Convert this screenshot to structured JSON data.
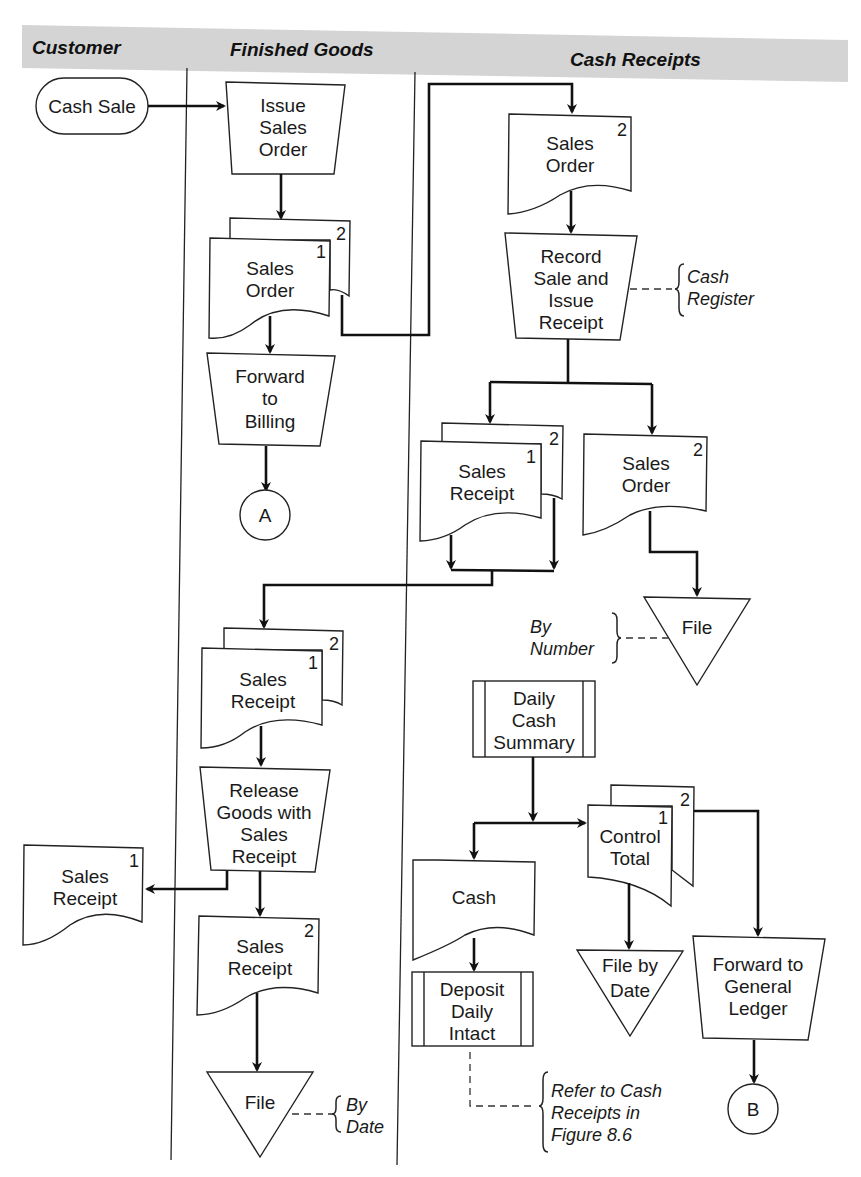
{
  "lanes": {
    "customer": "Customer",
    "finished_goods": "Finished Goods",
    "cash_receipts": "Cash Receipts"
  },
  "colors": {
    "header_band": "#d4d4d4",
    "line": "#111111",
    "background": "#ffffff"
  },
  "customer": {
    "start_terminal": "Cash Sale",
    "sales_receipt_copy": {
      "line1": "Sales",
      "line2": "Receipt",
      "copy": "1"
    }
  },
  "finished_goods": {
    "issue_sales_order": {
      "line1": "Issue",
      "line2": "Sales",
      "line3": "Order"
    },
    "sales_order_docs": {
      "line1": "Sales",
      "line2": "Order",
      "copy_front": "1",
      "copy_back": "2"
    },
    "forward_to_billing": {
      "line1": "Forward",
      "line2": "to",
      "line3": "Billing"
    },
    "connector_a": "A",
    "sales_receipt_docs": {
      "line1": "Sales",
      "line2": "Receipt",
      "copy_front": "1",
      "copy_back": "2"
    },
    "release_goods": {
      "line1": "Release",
      "line2": "Goods with",
      "line3": "Sales",
      "line4": "Receipt"
    },
    "sales_receipt_copy2": {
      "line1": "Sales",
      "line2": "Receipt",
      "copy": "2"
    },
    "file": "File",
    "file_note": {
      "line1": "By",
      "line2": "Date"
    }
  },
  "cash_receipts": {
    "sales_order_copy2": {
      "line1": "Sales",
      "line2": "Order",
      "copy": "2"
    },
    "record_sale": {
      "line1": "Record",
      "line2": "Sale and",
      "line3": "Issue",
      "line4": "Receipt"
    },
    "record_sale_note": {
      "line1": "Cash",
      "line2": "Register"
    },
    "sales_receipt_docs": {
      "line1": "Sales",
      "line2": "Receipt",
      "copy_front": "1",
      "copy_back": "2"
    },
    "sales_order_copy2b": {
      "line1": "Sales",
      "line2": "Order",
      "copy": "2"
    },
    "file": "File",
    "file_note": {
      "line1": "By",
      "line2": "Number"
    },
    "daily_cash_summary": {
      "line1": "Daily",
      "line2": "Cash",
      "line3": "Summary"
    },
    "control_total_docs": {
      "line1": "Control",
      "line2": "Total",
      "copy_front": "1",
      "copy_back": "2"
    },
    "cash_doc": "Cash",
    "deposit": {
      "line1": "Deposit",
      "line2": "Daily",
      "line3": "Intact"
    },
    "deposit_note": {
      "line1": "Refer to Cash",
      "line2": "Receipts in",
      "line3": "Figure 8.6"
    },
    "file_by_date": {
      "line1": "File by",
      "line2": "Date"
    },
    "forward_to_gl": {
      "line1": "Forward to",
      "line2": "General",
      "line3": "Ledger"
    },
    "connector_b": "B"
  }
}
